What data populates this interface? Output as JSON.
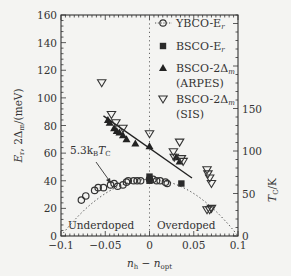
{
  "chart_data": {
    "type": "scatter",
    "title": "",
    "xlabel": "n_h − n_opt",
    "ylabel": "E_r, 2Δ_m/(meV)",
    "ylabel_right": "T_C/K",
    "xlim": [
      -0.1,
      0.1
    ],
    "ylim": [
      0,
      160
    ],
    "ylim_right": [
      0,
      260
    ],
    "x_ticks": [
      "−0.1",
      "−0.05",
      "0",
      "0.05",
      "0.1"
    ],
    "y_ticks": [
      "0",
      "20",
      "40",
      "60",
      "80",
      "100",
      "120",
      "140",
      "160"
    ],
    "y_ticks_right": [
      "0",
      "50",
      "100",
      "150"
    ],
    "grid": false,
    "legend_position": "upper right",
    "annotations": [
      {
        "text": "5.3k_BT_C",
        "points_to": [
          -0.035,
          42
        ]
      },
      {
        "text": "Underdoped",
        "x": -0.06,
        "y": 7
      },
      {
        "text": "Overdoped",
        "x": 0.04,
        "y": 7
      }
    ],
    "series": [
      {
        "name": "YBCO-E_r",
        "marker": "open-circle",
        "x": [
          -0.077,
          -0.072,
          -0.062,
          -0.058,
          -0.052,
          -0.044,
          -0.04,
          -0.036,
          -0.03,
          -0.026,
          -0.024,
          -0.018,
          -0.014,
          -0.01,
          0.0,
          0.004,
          0.008,
          0.012,
          0.018,
          0.02
        ],
        "y": [
          26,
          29,
          33,
          35,
          35,
          37,
          38,
          36,
          37,
          39,
          40,
          40,
          40,
          40,
          41,
          41,
          40,
          40,
          39,
          38
        ]
      },
      {
        "name": "BSCO-E_r",
        "marker": "filled-square",
        "x": [
          0.0,
          0.0,
          0.036
        ],
        "y": [
          43,
          40,
          38
        ]
      },
      {
        "name": "BSCO-2Δ_m (ARPES)",
        "marker": "filled-triangle-up",
        "x": [
          -0.047,
          -0.045,
          -0.04,
          -0.037,
          -0.034,
          -0.03,
          -0.026,
          -0.016,
          0.0,
          0.03,
          0.034
        ],
        "y": [
          84,
          82,
          78,
          76,
          75,
          73,
          70,
          67,
          65,
          57,
          54
        ],
        "fit_line": {
          "x": [
            -0.052,
            0.048
          ],
          "y": [
            87,
            42
          ]
        }
      },
      {
        "name": "BSCO-2Δ_m (SIS)",
        "marker": "open-triangle-down",
        "x": [
          -0.054,
          -0.043,
          -0.038,
          -0.03,
          0.0,
          0.027,
          0.028,
          0.034,
          0.036,
          0.038,
          0.065,
          0.066,
          0.068,
          0.07,
          0.065,
          0.068,
          0.07
        ],
        "y": [
          111,
          88,
          82,
          78,
          74,
          61,
          57,
          68,
          56,
          54,
          48,
          45,
          42,
          38,
          19,
          19,
          20
        ]
      },
      {
        "name": "T_C dome (dotted)",
        "marker": "none",
        "style": "dotted",
        "x": [
          -0.1,
          -0.075,
          -0.05,
          -0.025,
          0.0,
          0.025,
          0.05,
          0.075,
          0.1
        ],
        "y": [
          0,
          22,
          33,
          39,
          41,
          39,
          33,
          22,
          0
        ]
      }
    ]
  },
  "legend": {
    "items": [
      {
        "label": "YBCO-E",
        "sub": "r"
      },
      {
        "label": "BSCO-E",
        "sub": "r"
      },
      {
        "label": "BSCO-2Δ",
        "sub": "m",
        "extra": "(ARPES)"
      },
      {
        "label": "BSCO-2Δ",
        "sub": "m",
        "extra": "(SIS)"
      }
    ]
  },
  "labels": {
    "annotation": "5.3k",
    "annotation_sub_b": "B",
    "annotation_t": "T",
    "annotation_sub_c": "C",
    "underdoped": "Underdoped",
    "overdoped": "Overdoped",
    "xlabel_n": "n",
    "xlabel_h": "h",
    "xlabel_minus": " − n",
    "xlabel_opt": "opt",
    "ylabel": "E",
    "ylabel_r": "r",
    "ylabel_rest": ", 2Δ",
    "ylabel_m": "m",
    "ylabel_unit": "/(meV)",
    "ylabel_right": "T",
    "ylabel_right_c": "C",
    "ylabel_right_unit": "/K"
  }
}
